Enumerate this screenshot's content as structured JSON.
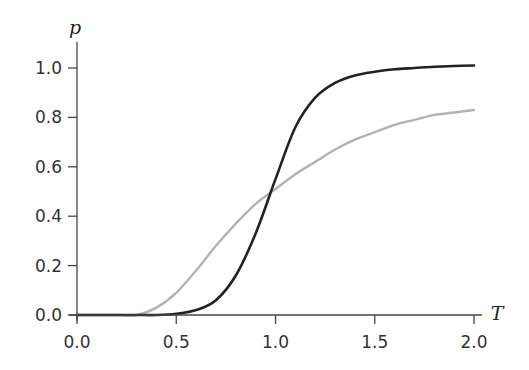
{
  "chart_data": {
    "type": "line",
    "title": "",
    "xlabel": "T",
    "ylabel": "p",
    "xlim": [
      0.0,
      2.0
    ],
    "ylim": [
      0.0,
      1.0
    ],
    "grid": false,
    "legend": null,
    "x_ticks": [
      "0.0",
      "0.5",
      "1.0",
      "1.5",
      "2.0"
    ],
    "y_ticks": [
      "0.0",
      "0.2",
      "0.4",
      "0.6",
      "0.8",
      "1.0"
    ],
    "x": [
      0.0,
      0.1,
      0.2,
      0.3,
      0.4,
      0.5,
      0.6,
      0.7,
      0.8,
      0.9,
      1.0,
      1.1,
      1.2,
      1.3,
      1.4,
      1.5,
      1.6,
      1.7,
      1.8,
      1.9,
      2.0
    ],
    "series": [
      {
        "name": "steep (black)",
        "color": "#222222",
        "values": [
          0.0,
          0.0,
          0.0,
          0.0,
          0.0,
          0.005,
          0.02,
          0.06,
          0.16,
          0.33,
          0.55,
          0.76,
          0.88,
          0.94,
          0.97,
          0.985,
          0.995,
          1.0,
          1.005,
          1.008,
          1.01
        ]
      },
      {
        "name": "shallow (gray)",
        "color": "#b3b3b3",
        "values": [
          0.0,
          0.0,
          0.0,
          0.0,
          0.03,
          0.09,
          0.18,
          0.28,
          0.37,
          0.45,
          0.51,
          0.57,
          0.62,
          0.67,
          0.71,
          0.74,
          0.77,
          0.79,
          0.81,
          0.82,
          0.83
        ]
      }
    ]
  }
}
